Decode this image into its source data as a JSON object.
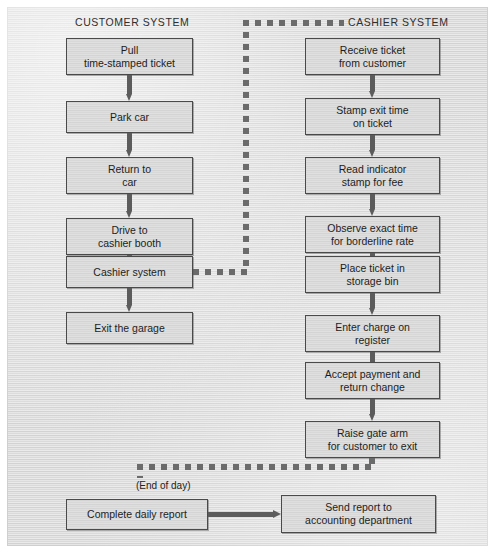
{
  "diagram": {
    "columns": [
      {
        "id": "customer",
        "label": "CUSTOMER SYSTEM"
      },
      {
        "id": "cashier",
        "label": "CASHIER SYSTEM"
      }
    ],
    "customer_steps": [
      {
        "id": "pull-ticket",
        "line1": "Pull",
        "line2": "time-stamped ticket"
      },
      {
        "id": "park-car",
        "line1": "Park car",
        "line2": ""
      },
      {
        "id": "return-to-car",
        "line1": "Return to",
        "line2": "car"
      },
      {
        "id": "drive-to-booth",
        "line1": "Drive to",
        "line2": "cashier booth"
      },
      {
        "id": "cashier-system",
        "line1": "Cashier system",
        "line2": ""
      },
      {
        "id": "exit-garage",
        "line1": "Exit the garage",
        "line2": ""
      }
    ],
    "cashier_steps": [
      {
        "id": "receive-ticket",
        "line1": "Receive ticket",
        "line2": "from customer"
      },
      {
        "id": "stamp-exit-time",
        "line1": "Stamp exit time",
        "line2": "on ticket"
      },
      {
        "id": "read-indicator",
        "line1": "Read indicator",
        "line2": "stamp for fee"
      },
      {
        "id": "observe-exact-time",
        "line1": "Observe exact time",
        "line2": "for borderline rate"
      },
      {
        "id": "place-ticket",
        "line1": "Place ticket in",
        "line2": "storage bin"
      },
      {
        "id": "enter-charge",
        "line1": "Enter charge on",
        "line2": "register"
      },
      {
        "id": "accept-payment",
        "line1": "Accept payment and",
        "line2": "return change"
      },
      {
        "id": "raise-gate-arm",
        "line1": "Raise gate arm",
        "line2": "for customer to exit"
      }
    ],
    "end_of_day": {
      "note": "(End of day)",
      "steps": [
        {
          "id": "complete-daily-report",
          "line1": "Complete daily report",
          "line2": ""
        },
        {
          "id": "send-report",
          "line1": "Send report to",
          "line2": "accounting department"
        }
      ]
    },
    "colors": {
      "paper": "#dcdcdc",
      "box_fill": "#d9d9d9",
      "box_border": "#4a4a4a",
      "arrow": "#5c5c5c",
      "dashed": "#6b6b6b",
      "text": "#1d1d1d"
    }
  }
}
